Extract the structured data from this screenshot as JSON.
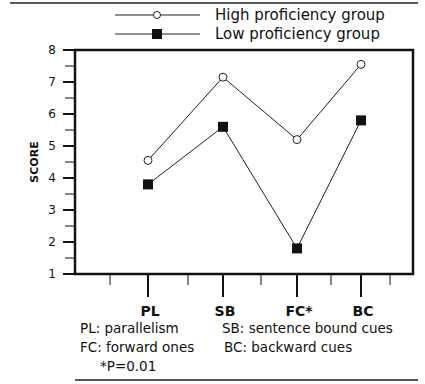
{
  "chart_data": {
    "type": "line",
    "title": "",
    "xlabel": "",
    "ylabel": "SCORE",
    "categories": [
      "PL",
      "SB",
      "FC*",
      "BC"
    ],
    "ylim": [
      1,
      8
    ],
    "yticks": [
      1,
      2,
      3,
      4,
      5,
      6,
      7,
      8
    ],
    "grid": false,
    "legend_position": "top",
    "series": [
      {
        "name": "High proficiency group",
        "marker": "open-circle",
        "values": [
          4.55,
          7.15,
          5.2,
          7.55
        ]
      },
      {
        "name": "Low proficiency group",
        "marker": "filled-square",
        "values": [
          3.8,
          5.6,
          1.8,
          5.8
        ]
      }
    ],
    "annotations": [
      "PL: parallelism",
      "SB: sentence bound cues",
      "FC: forward ones",
      "BC: backward cues",
      "*P=0.01"
    ]
  },
  "legend": {
    "high": "High proficiency group",
    "low": "Low proficiency group"
  },
  "notes": {
    "pl": "PL:  parallelism",
    "sb": "SB:  sentence bound cues",
    "fc": "FC:  forward ones",
    "bc": "BC:  backward cues",
    "p": "*P=0.01"
  }
}
